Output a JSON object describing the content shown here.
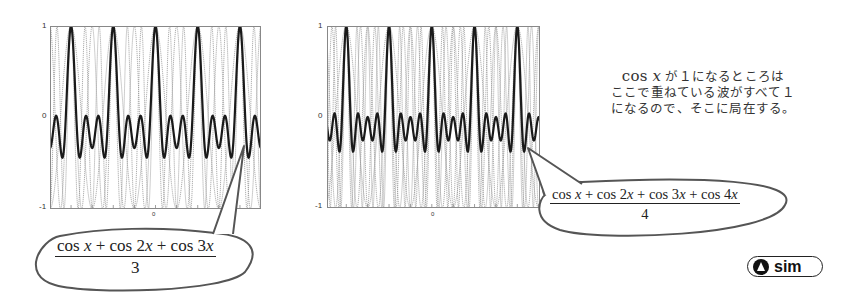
{
  "chart_data": [
    {
      "type": "line",
      "title": "",
      "xlabel": "",
      "ylabel": "",
      "x_range_radians": [
        -15.7,
        15.7
      ],
      "ylim": [
        -1,
        1
      ],
      "y_ticks": [
        "1",
        "0",
        "-1"
      ],
      "x_ticks": [
        "0"
      ],
      "grid": false,
      "series": [
        {
          "name": "(cos x + cos 2x + cos 3x)/3",
          "style": "thick solid dark",
          "formula_terms": 3
        },
        {
          "name": "cos x",
          "style": "thin dotted gray"
        },
        {
          "name": "cos 2x",
          "style": "thin dotted gray"
        },
        {
          "name": "cos 3x",
          "style": "thin dotted gray"
        }
      ],
      "peaks_at_value_1": 5,
      "annotation": "(cos x + cos 2x + cos 3x) / 3"
    },
    {
      "type": "line",
      "title": "",
      "xlabel": "",
      "ylabel": "",
      "x_range_radians": [
        -15.7,
        15.7
      ],
      "ylim": [
        -1,
        1
      ],
      "y_ticks": [
        "1",
        "0",
        "-1"
      ],
      "x_ticks": [
        "0"
      ],
      "grid": false,
      "series": [
        {
          "name": "(cos x + cos 2x + cos 3x + cos 4x)/4",
          "style": "thick solid dark",
          "formula_terms": 4
        },
        {
          "name": "cos x",
          "style": "thin dotted gray"
        },
        {
          "name": "cos 2x",
          "style": "thin dotted gray"
        },
        {
          "name": "cos 3x",
          "style": "thin dotted gray"
        },
        {
          "name": "cos 4x",
          "style": "thin dotted gray"
        }
      ],
      "peaks_at_value_1": 5,
      "annotation": "(cos x + cos 2x + cos 3x + cos 4x) / 4"
    }
  ],
  "plots": {
    "left": {
      "terms": 3,
      "x_min": -15.7,
      "x_max": 15.7,
      "y_tick_top": "1",
      "y_tick_mid": "0",
      "y_tick_bottom": "-1",
      "x_tick_center": "0"
    },
    "right": {
      "terms": 4,
      "x_min": -15.4,
      "x_max": 15.9,
      "y_tick_top": "1",
      "y_tick_mid": "0",
      "y_tick_bottom": "-1",
      "x_tick_center": "0"
    }
  },
  "formulas": {
    "left": {
      "numerator_parts": [
        "cos ",
        "x",
        " + cos 2",
        "x",
        " + cos 3",
        "x"
      ],
      "denominator": "3"
    },
    "right": {
      "numerator_parts": [
        "cos ",
        "x",
        " + cos 2",
        "x",
        " + cos 3",
        "x",
        " + cos 4",
        "x"
      ],
      "denominator": "4"
    }
  },
  "caption": {
    "math_prefix": "cos ",
    "math_var": "x",
    "line1_rest": " が１になるところは",
    "line2": "ここで重ねている波がすべて１",
    "line3": "になるので、そこに局在する。"
  },
  "sim_button": {
    "label": "sim",
    "icon": "play-triangle-circle-icon"
  },
  "colors": {
    "main_curve": "#1a1a1a",
    "component_curves": "#9a9a9a",
    "axes": "#888888",
    "bubble_outline": "#555555"
  }
}
